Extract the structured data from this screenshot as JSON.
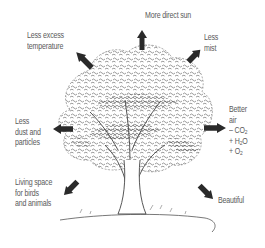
{
  "diagram": {
    "center": "tree-illustration",
    "labels": {
      "sun": "More direct sun",
      "temperature": [
        "Less excess",
        "temperature"
      ],
      "mist": [
        "Less",
        "mist"
      ],
      "dust": [
        "Less",
        "dust and",
        "particles"
      ],
      "air": [
        "Better",
        "air"
      ],
      "air_co2": "– CO",
      "air_h2o_a": "+ H",
      "air_h2o_b": "O",
      "air_o2": "+ O",
      "sub2": "2",
      "living": [
        "Living space",
        "for birds",
        "and animals"
      ],
      "beautiful": "Beautiful"
    },
    "arrows": [
      {
        "name": "sun",
        "direction": "up"
      },
      {
        "name": "temperature",
        "direction": "up-left"
      },
      {
        "name": "mist",
        "direction": "up-right"
      },
      {
        "name": "dust",
        "direction": "left"
      },
      {
        "name": "air",
        "direction": "right"
      },
      {
        "name": "living",
        "direction": "down-left"
      },
      {
        "name": "beautiful",
        "direction": "down-right"
      }
    ],
    "colors": {
      "arrow": "#2a2a2a",
      "text": "#5a5a5a",
      "foliage": "#444444"
    }
  }
}
